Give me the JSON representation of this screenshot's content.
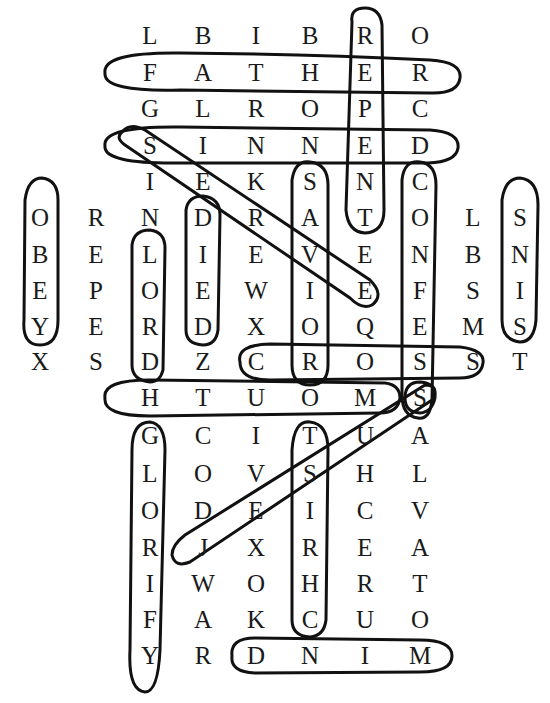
{
  "puzzle": {
    "type": "word-search",
    "grid": [
      {
        "y": 36,
        "cells": [
          {
            "c": 3,
            "l": "L"
          },
          {
            "c": 4,
            "l": "B"
          },
          {
            "c": 5,
            "l": "I"
          },
          {
            "c": 6,
            "l": "B"
          },
          {
            "c": 7,
            "l": "R"
          },
          {
            "c": 8,
            "l": "O"
          }
        ]
      },
      {
        "y": 73,
        "cells": [
          {
            "c": 3,
            "l": "F"
          },
          {
            "c": 4,
            "l": "A"
          },
          {
            "c": 5,
            "l": "T"
          },
          {
            "c": 6,
            "l": "H"
          },
          {
            "c": 7,
            "l": "E"
          },
          {
            "c": 8,
            "l": "R"
          }
        ]
      },
      {
        "y": 109,
        "cells": [
          {
            "c": 3,
            "l": "G"
          },
          {
            "c": 4,
            "l": "L"
          },
          {
            "c": 5,
            "l": "R"
          },
          {
            "c": 6,
            "l": "O"
          },
          {
            "c": 7,
            "l": "P"
          },
          {
            "c": 8,
            "l": "C"
          }
        ]
      },
      {
        "y": 146,
        "cells": [
          {
            "c": 3,
            "l": "S"
          },
          {
            "c": 4,
            "l": "I"
          },
          {
            "c": 5,
            "l": "N"
          },
          {
            "c": 6,
            "l": "N"
          },
          {
            "c": 7,
            "l": "E"
          },
          {
            "c": 8,
            "l": "D"
          }
        ]
      },
      {
        "y": 182,
        "cells": [
          {
            "c": 3,
            "l": "I"
          },
          {
            "c": 4,
            "l": "E"
          },
          {
            "c": 5,
            "l": "K"
          },
          {
            "c": 6,
            "l": "S"
          },
          {
            "c": 7,
            "l": "N"
          },
          {
            "c": 8,
            "l": "C"
          }
        ]
      },
      {
        "y": 218,
        "cells": [
          {
            "c": 1,
            "l": "O"
          },
          {
            "c": 2,
            "l": "R"
          },
          {
            "c": 3,
            "l": "N"
          },
          {
            "c": 4,
            "l": "D"
          },
          {
            "c": 5,
            "l": "R"
          },
          {
            "c": 6,
            "l": "A"
          },
          {
            "c": 7,
            "l": "T"
          },
          {
            "c": 8,
            "l": "O"
          },
          {
            "c": 9,
            "l": "L"
          },
          {
            "c": 10,
            "l": "S"
          }
        ]
      },
      {
        "y": 255,
        "cells": [
          {
            "c": 1,
            "l": "B"
          },
          {
            "c": 2,
            "l": "E"
          },
          {
            "c": 3,
            "l": "L"
          },
          {
            "c": 4,
            "l": "I"
          },
          {
            "c": 5,
            "l": "E"
          },
          {
            "c": 6,
            "l": "V"
          },
          {
            "c": 7,
            "l": "E"
          },
          {
            "c": 8,
            "l": "N"
          },
          {
            "c": 9,
            "l": "B"
          },
          {
            "c": 10,
            "l": "N"
          }
        ]
      },
      {
        "y": 291,
        "cells": [
          {
            "c": 1,
            "l": "E"
          },
          {
            "c": 2,
            "l": "P"
          },
          {
            "c": 3,
            "l": "O"
          },
          {
            "c": 4,
            "l": "E"
          },
          {
            "c": 5,
            "l": "W"
          },
          {
            "c": 6,
            "l": "I"
          },
          {
            "c": 7,
            "l": "E"
          },
          {
            "c": 8,
            "l": "F"
          },
          {
            "c": 9,
            "l": "S"
          },
          {
            "c": 10,
            "l": "I"
          }
        ]
      },
      {
        "y": 327,
        "cells": [
          {
            "c": 1,
            "l": "Y"
          },
          {
            "c": 2,
            "l": "E"
          },
          {
            "c": 3,
            "l": "R"
          },
          {
            "c": 4,
            "l": "D"
          },
          {
            "c": 5,
            "l": "X"
          },
          {
            "c": 6,
            "l": "O"
          },
          {
            "c": 7,
            "l": "Q"
          },
          {
            "c": 8,
            "l": "E"
          },
          {
            "c": 9,
            "l": "M"
          },
          {
            "c": 10,
            "l": "S"
          }
        ]
      },
      {
        "y": 362,
        "cells": [
          {
            "c": 1,
            "l": "X"
          },
          {
            "c": 2,
            "l": "S"
          },
          {
            "c": 3,
            "l": "D"
          },
          {
            "c": 4,
            "l": "Z"
          },
          {
            "c": 5,
            "l": "C"
          },
          {
            "c": 6,
            "l": "R"
          },
          {
            "c": 7,
            "l": "O"
          },
          {
            "c": 8,
            "l": "S"
          },
          {
            "c": 9,
            "l": "S"
          },
          {
            "c": 10,
            "l": "T"
          }
        ]
      },
      {
        "y": 398,
        "cells": [
          {
            "c": 3,
            "l": "H"
          },
          {
            "c": 4,
            "l": "T"
          },
          {
            "c": 5,
            "l": "U"
          },
          {
            "c": 6,
            "l": "O"
          },
          {
            "c": 7,
            "l": "M"
          },
          {
            "c": 8,
            "l": "S"
          }
        ]
      },
      {
        "y": 436,
        "cells": [
          {
            "c": 3,
            "l": "G"
          },
          {
            "c": 4,
            "l": "C"
          },
          {
            "c": 5,
            "l": "I"
          },
          {
            "c": 6,
            "l": "T"
          },
          {
            "c": 7,
            "l": "U"
          },
          {
            "c": 8,
            "l": "A"
          }
        ]
      },
      {
        "y": 474,
        "cells": [
          {
            "c": 3,
            "l": "L"
          },
          {
            "c": 4,
            "l": "O"
          },
          {
            "c": 5,
            "l": "V"
          },
          {
            "c": 6,
            "l": "S"
          },
          {
            "c": 7,
            "l": "H"
          },
          {
            "c": 8,
            "l": "L"
          }
        ]
      },
      {
        "y": 511,
        "cells": [
          {
            "c": 3,
            "l": "O"
          },
          {
            "c": 4,
            "l": "D"
          },
          {
            "c": 5,
            "l": "E"
          },
          {
            "c": 6,
            "l": "I"
          },
          {
            "c": 7,
            "l": "C"
          },
          {
            "c": 8,
            "l": "V"
          }
        ]
      },
      {
        "y": 548,
        "cells": [
          {
            "c": 3,
            "l": "R"
          },
          {
            "c": 4,
            "l": "J"
          },
          {
            "c": 5,
            "l": "X"
          },
          {
            "c": 6,
            "l": "R"
          },
          {
            "c": 7,
            "l": "E"
          },
          {
            "c": 8,
            "l": "A"
          }
        ]
      },
      {
        "y": 584,
        "cells": [
          {
            "c": 3,
            "l": "I"
          },
          {
            "c": 4,
            "l": "W"
          },
          {
            "c": 5,
            "l": "O"
          },
          {
            "c": 6,
            "l": "H"
          },
          {
            "c": 7,
            "l": "R"
          },
          {
            "c": 8,
            "l": "T"
          }
        ]
      },
      {
        "y": 620,
        "cells": [
          {
            "c": 3,
            "l": "F"
          },
          {
            "c": 4,
            "l": "A"
          },
          {
            "c": 5,
            "l": "K"
          },
          {
            "c": 6,
            "l": "C"
          },
          {
            "c": 7,
            "l": "U"
          },
          {
            "c": 8,
            "l": "O"
          }
        ]
      },
      {
        "y": 656,
        "cells": [
          {
            "c": 3,
            "l": "Y"
          },
          {
            "c": 4,
            "l": "R"
          },
          {
            "c": 5,
            "l": "D"
          },
          {
            "c": 6,
            "l": "N"
          },
          {
            "c": 7,
            "l": "I"
          },
          {
            "c": 8,
            "l": "M"
          }
        ]
      }
    ],
    "column_x": {
      "1": 40,
      "2": 96,
      "3": 150,
      "4": 203,
      "5": 256,
      "6": 310,
      "7": 365,
      "8": 420,
      "9": 473,
      "10": 520
    },
    "found_words": [
      "REPENT",
      "FATHER",
      "SINNED",
      "SEEKE",
      "SAVIOR",
      "CONFESS",
      "OBEY",
      "SNIS",
      "LORD",
      "DIED",
      "CROSS",
      "HTUOMS",
      "GLORIFY",
      "CHRIST",
      "SJ",
      "MIND"
    ]
  }
}
